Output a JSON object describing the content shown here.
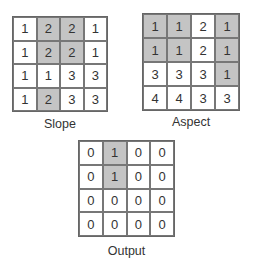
{
  "grids": [
    {
      "name": "slope",
      "label": "Slope",
      "cells": [
        [
          {
            "v": "1",
            "s": false
          },
          {
            "v": "2",
            "s": true
          },
          {
            "v": "2",
            "s": true
          },
          {
            "v": "1",
            "s": false
          }
        ],
        [
          {
            "v": "1",
            "s": false
          },
          {
            "v": "2",
            "s": true
          },
          {
            "v": "2",
            "s": true
          },
          {
            "v": "1",
            "s": false
          }
        ],
        [
          {
            "v": "1",
            "s": false
          },
          {
            "v": "1",
            "s": false
          },
          {
            "v": "3",
            "s": false
          },
          {
            "v": "3",
            "s": false
          }
        ],
        [
          {
            "v": "1",
            "s": false
          },
          {
            "v": "2",
            "s": true
          },
          {
            "v": "3",
            "s": false
          },
          {
            "v": "3",
            "s": false
          }
        ]
      ]
    },
    {
      "name": "aspect",
      "label": "Aspect",
      "cells": [
        [
          {
            "v": "1",
            "s": true
          },
          {
            "v": "1",
            "s": true
          },
          {
            "v": "2",
            "s": false
          },
          {
            "v": "1",
            "s": true
          }
        ],
        [
          {
            "v": "1",
            "s": true
          },
          {
            "v": "1",
            "s": true
          },
          {
            "v": "2",
            "s": false
          },
          {
            "v": "1",
            "s": true
          }
        ],
        [
          {
            "v": "3",
            "s": false
          },
          {
            "v": "3",
            "s": false
          },
          {
            "v": "3",
            "s": false
          },
          {
            "v": "1",
            "s": true
          }
        ],
        [
          {
            "v": "4",
            "s": false
          },
          {
            "v": "4",
            "s": false
          },
          {
            "v": "3",
            "s": false
          },
          {
            "v": "3",
            "s": false
          }
        ]
      ]
    },
    {
      "name": "output",
      "label": "Output",
      "cells": [
        [
          {
            "v": "0",
            "s": false
          },
          {
            "v": "1",
            "s": true
          },
          {
            "v": "0",
            "s": false
          },
          {
            "v": "0",
            "s": false
          }
        ],
        [
          {
            "v": "0",
            "s": false
          },
          {
            "v": "1",
            "s": true
          },
          {
            "v": "0",
            "s": false
          },
          {
            "v": "0",
            "s": false
          }
        ],
        [
          {
            "v": "0",
            "s": false
          },
          {
            "v": "0",
            "s": false
          },
          {
            "v": "0",
            "s": false
          },
          {
            "v": "0",
            "s": false
          }
        ],
        [
          {
            "v": "0",
            "s": false
          },
          {
            "v": "0",
            "s": false
          },
          {
            "v": "0",
            "s": false
          },
          {
            "v": "0",
            "s": false
          }
        ]
      ]
    }
  ],
  "colors": {
    "shaded": "#c4c4c4",
    "unshaded": "#ffffff",
    "border": "#666666"
  }
}
